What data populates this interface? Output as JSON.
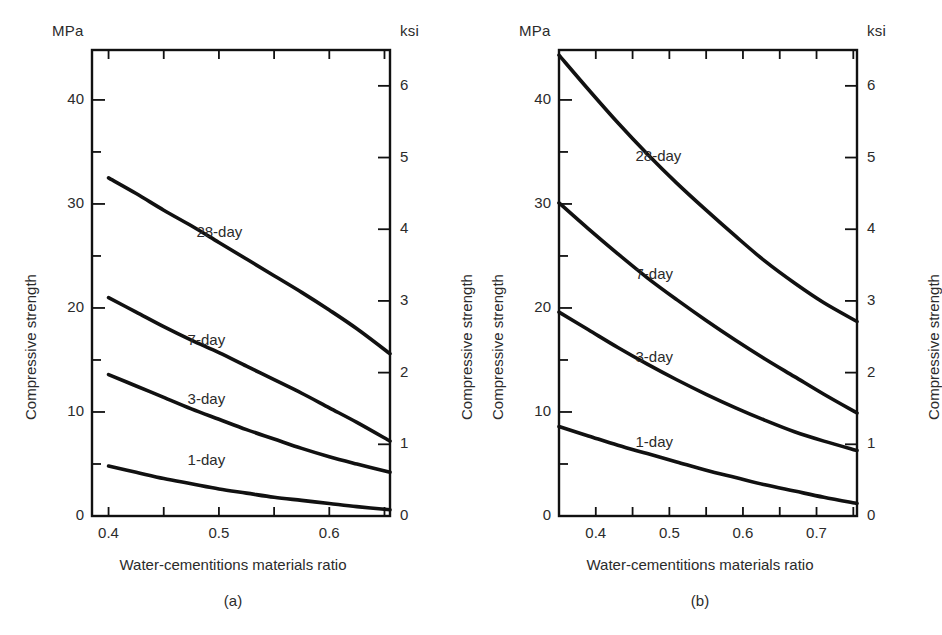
{
  "figure": {
    "background": "#ffffff",
    "line_color": "#111111",
    "text_color": "#2b2b2b"
  },
  "chart_data": [
    {
      "type": "line",
      "panel": "(a)",
      "title": "",
      "xlabel": "Water-cementitions materials ratio",
      "ylabel": "Compressive strength",
      "ylabel_right": "Compressive strength",
      "yunit_left": "MPa",
      "yunit_right": "ksi",
      "xlim": [
        0.385,
        0.655
      ],
      "ylim": [
        0,
        44.8
      ],
      "ylim_right": [
        0,
        6.5
      ],
      "xticks": [
        0.4,
        0.5,
        0.6
      ],
      "xtick_labels": [
        "0.4",
        "0.5",
        "0.6"
      ],
      "xminor_ticks": [
        0.45,
        0.55,
        0.65
      ],
      "yticks_left": [
        0,
        10,
        20,
        30,
        40
      ],
      "ytick_labels_left": [
        "0",
        "10",
        "20",
        "30",
        "40"
      ],
      "yminor_ticks_left": [
        5,
        15,
        25,
        35
      ],
      "yticks_right": [
        0,
        1,
        2,
        3,
        4,
        5,
        6
      ],
      "ytick_labels_right": [
        "0",
        "1",
        "2",
        "3",
        "4",
        "5",
        "6"
      ],
      "grid": false,
      "legend_position": "inline-annotations",
      "series": [
        {
          "name": "28-day",
          "label": "28-day",
          "label_x": 0.505,
          "label_y": 27.2,
          "x": [
            0.4,
            0.425,
            0.45,
            0.475,
            0.5,
            0.525,
            0.55,
            0.575,
            0.6,
            0.625,
            0.655
          ],
          "values": [
            32.5,
            31.0,
            29.4,
            27.9,
            26.3,
            24.7,
            23.1,
            21.5,
            19.8,
            18.0,
            15.6
          ]
        },
        {
          "name": "7-day",
          "label": "7-day",
          "label_x": 0.497,
          "label_y": 16.8,
          "x": [
            0.4,
            0.425,
            0.45,
            0.475,
            0.5,
            0.525,
            0.55,
            0.575,
            0.6,
            0.625,
            0.655
          ],
          "values": [
            21.0,
            19.6,
            18.2,
            16.9,
            15.7,
            14.4,
            13.1,
            11.8,
            10.4,
            9.0,
            7.2
          ]
        },
        {
          "name": "3-day",
          "label": "3-day",
          "label_x": 0.497,
          "label_y": 11.2,
          "x": [
            0.4,
            0.425,
            0.45,
            0.475,
            0.5,
            0.525,
            0.55,
            0.575,
            0.6,
            0.625,
            0.655
          ],
          "values": [
            13.6,
            12.5,
            11.4,
            10.3,
            9.3,
            8.3,
            7.4,
            6.5,
            5.7,
            5.0,
            4.2
          ]
        },
        {
          "name": "1-day",
          "label": "1-day",
          "label_x": 0.497,
          "label_y": 5.3,
          "x": [
            0.4,
            0.425,
            0.45,
            0.475,
            0.5,
            0.525,
            0.55,
            0.575,
            0.6,
            0.625,
            0.655
          ],
          "values": [
            4.8,
            4.2,
            3.6,
            3.1,
            2.6,
            2.2,
            1.8,
            1.5,
            1.2,
            0.9,
            0.6
          ]
        }
      ]
    },
    {
      "type": "line",
      "panel": "(b)",
      "title": "",
      "xlabel": "Water-cementitions materials ratio",
      "ylabel": "Compressive strength",
      "ylabel_right": "Compressive strength",
      "yunit_left": "MPa",
      "yunit_right": "ksi",
      "xlim": [
        0.35,
        0.755
      ],
      "ylim": [
        0,
        44.8
      ],
      "ylim_right": [
        0,
        6.5
      ],
      "xticks": [
        0.4,
        0.5,
        0.6,
        0.7
      ],
      "xtick_labels": [
        "0.4",
        "0.5",
        "0.6",
        "0.7"
      ],
      "xminor_ticks": [
        0.45,
        0.55,
        0.65,
        0.75
      ],
      "yticks_left": [
        0,
        10,
        20,
        30,
        40
      ],
      "ytick_labels_left": [
        "0",
        "10",
        "20",
        "30",
        "40"
      ],
      "yminor_ticks_left": [
        5,
        15,
        25,
        35
      ],
      "yticks_right": [
        0,
        1,
        2,
        3,
        4,
        5,
        6
      ],
      "ytick_labels_right": [
        "0",
        "1",
        "2",
        "3",
        "4",
        "5",
        "6"
      ],
      "grid": false,
      "legend_position": "inline-annotations",
      "series": [
        {
          "name": "28-day",
          "label": "28-day",
          "label_x": 0.492,
          "label_y": 34.5,
          "x": [
            0.35,
            0.39,
            0.43,
            0.47,
            0.51,
            0.55,
            0.59,
            0.63,
            0.67,
            0.71,
            0.755
          ],
          "values": [
            44.3,
            41.0,
            37.8,
            34.8,
            32.0,
            29.4,
            26.9,
            24.5,
            22.4,
            20.5,
            18.7
          ]
        },
        {
          "name": "7-day",
          "label": "7-day",
          "label_x": 0.492,
          "label_y": 23.2,
          "x": [
            0.35,
            0.39,
            0.43,
            0.47,
            0.51,
            0.55,
            0.59,
            0.63,
            0.67,
            0.71,
            0.755
          ],
          "values": [
            30.1,
            27.6,
            25.2,
            22.9,
            20.8,
            18.8,
            16.9,
            15.1,
            13.4,
            11.7,
            9.9
          ]
        },
        {
          "name": "3-day",
          "label": "3-day",
          "label_x": 0.492,
          "label_y": 15.2,
          "x": [
            0.35,
            0.39,
            0.43,
            0.47,
            0.51,
            0.55,
            0.59,
            0.63,
            0.67,
            0.71,
            0.755
          ],
          "values": [
            19.6,
            17.9,
            16.2,
            14.6,
            13.1,
            11.7,
            10.4,
            9.2,
            8.1,
            7.2,
            6.3
          ]
        },
        {
          "name": "1-day",
          "label": "1-day",
          "label_x": 0.492,
          "label_y": 7.0,
          "x": [
            0.35,
            0.39,
            0.43,
            0.47,
            0.51,
            0.55,
            0.59,
            0.63,
            0.67,
            0.71,
            0.755
          ],
          "values": [
            8.6,
            7.7,
            6.8,
            6.0,
            5.2,
            4.4,
            3.7,
            3.0,
            2.4,
            1.8,
            1.2
          ]
        }
      ]
    }
  ],
  "panel_a": {
    "unit_left": "MPa",
    "unit_right": "ksi",
    "ylabel_left": "Compressive strength",
    "ylabel_right": "Compressive strength",
    "xlabel": "Water-cementitions materials ratio",
    "caption": "(a)"
  },
  "panel_b": {
    "unit_left": "MPa",
    "unit_right": "ksi",
    "ylabel_left": "Compressive strength",
    "ylabel_right": "Compressive strength",
    "xlabel": "Water-cementitions materials ratio",
    "caption": "(b)"
  }
}
